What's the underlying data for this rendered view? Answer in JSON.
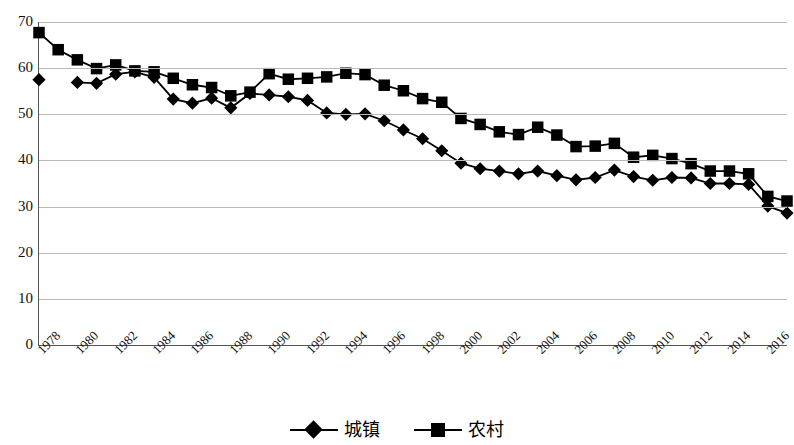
{
  "chart_data": {
    "type": "line",
    "title": "",
    "xlabel": "",
    "ylabel": "",
    "ylim": [
      0,
      70
    ],
    "ytick_values": [
      0,
      10,
      20,
      30,
      40,
      50,
      60,
      70
    ],
    "ytick_labels": [
      "0",
      "10",
      "20",
      "30",
      "40",
      "50",
      "60",
      "70"
    ],
    "grid": true,
    "legend_position": "bottom-center",
    "x": [
      1978,
      1979,
      1980,
      1981,
      1982,
      1983,
      1984,
      1985,
      1986,
      1987,
      1988,
      1989,
      1990,
      1991,
      1992,
      1993,
      1994,
      1995,
      1996,
      1997,
      1998,
      1999,
      2000,
      2001,
      2002,
      2003,
      2004,
      2005,
      2006,
      2007,
      2008,
      2009,
      2010,
      2011,
      2012,
      2013,
      2014,
      2015,
      2016,
      2017
    ],
    "xtick_labels": [
      "1978",
      "1980",
      "1982",
      "1984",
      "1986",
      "1988",
      "1990",
      "1992",
      "1994",
      "1996",
      "1998",
      "2000",
      "2002",
      "2004",
      "2006",
      "2008",
      "2010",
      "2012",
      "2014",
      "2016"
    ],
    "series": [
      {
        "name": "城镇",
        "marker": "diamond",
        "color": "#000000",
        "values": [
          57.5,
          null,
          56.9,
          56.7,
          58.7,
          59.2,
          58.0,
          53.3,
          52.4,
          53.5,
          51.4,
          54.5,
          54.2,
          53.8,
          53.0,
          50.3,
          50.0,
          50.1,
          48.6,
          46.6,
          44.7,
          42.1,
          39.4,
          38.2,
          37.7,
          37.1,
          37.7,
          36.7,
          35.8,
          36.3,
          37.9,
          36.5,
          35.7,
          36.3,
          36.2,
          35.0,
          35.0,
          34.8,
          30.1,
          28.6
        ]
      },
      {
        "name": "农村",
        "marker": "square",
        "color": "#000000",
        "values": [
          67.7,
          64.0,
          61.8,
          59.9,
          60.7,
          59.4,
          59.2,
          57.8,
          56.4,
          55.8,
          54.0,
          54.8,
          58.8,
          57.6,
          57.8,
          58.1,
          58.9,
          58.6,
          56.3,
          55.1,
          53.4,
          52.6,
          49.1,
          47.8,
          46.2,
          45.6,
          47.2,
          45.5,
          43.0,
          43.1,
          43.7,
          40.7,
          41.1,
          40.4,
          39.3,
          37.7,
          37.7,
          37.1,
          32.2,
          31.2
        ]
      }
    ]
  },
  "legend": {
    "items": [
      {
        "label": "城镇",
        "marker": "diamond"
      },
      {
        "label": "农村",
        "marker": "square"
      }
    ]
  }
}
